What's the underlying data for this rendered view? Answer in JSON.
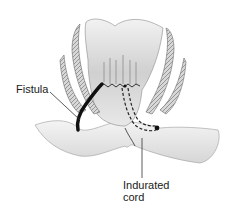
{
  "diagram": {
    "labels": {
      "fistula": "Fistula",
      "indurated_cord_line1": "Indurated",
      "indurated_cord_line2": "cord"
    },
    "colors": {
      "background": "#ffffff",
      "tissue_light": "#e6e6e6",
      "tissue_mid": "#bdbdbd",
      "tissue_dark": "#8a8a8a",
      "fistula_tract": "#111111",
      "ink": "#1a1a1a"
    }
  }
}
